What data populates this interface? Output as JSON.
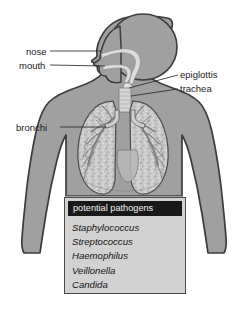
{
  "diagram": {
    "view": "anterior torso with left-facing head profile",
    "background_color": "#ffffff",
    "body_fill_color": "#a0a0a0",
    "body_outline_color": "#3c3c3c",
    "lung_fill_color": "#c8c8c8",
    "airway_color": "#d8d8d8"
  },
  "labels": [
    {
      "id": "nose",
      "text": "nose",
      "side": "left"
    },
    {
      "id": "mouth",
      "text": "mouth",
      "side": "left"
    },
    {
      "id": "bronchi",
      "text": "bronchi",
      "side": "left"
    },
    {
      "id": "epiglottis",
      "text": "epiglottis",
      "side": "right"
    },
    {
      "id": "trachea",
      "text": "trachea",
      "side": "right"
    }
  ],
  "pathogen_panel": {
    "header": "potential pathogens",
    "header_bg_color": "#191919",
    "header_text_color": "#f2f2f2",
    "panel_bg_color": "#d2d2d2",
    "panel_border_color": "#4a4a4a",
    "items": [
      "Staphylococcus",
      "Streptococcus",
      "Haemophilus",
      "Veillonella",
      "Candida"
    ]
  }
}
